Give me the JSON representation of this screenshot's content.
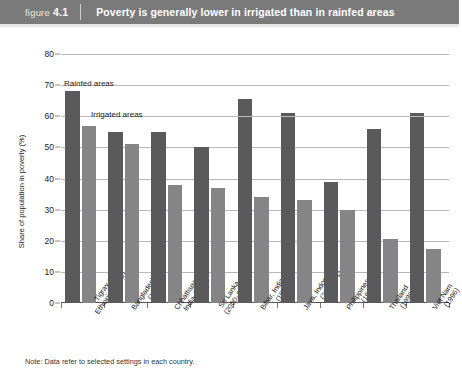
{
  "header": {
    "figure_word": "figure",
    "figure_number": "4.1",
    "title": "Poverty is generally lower in irrigated than in rainfed areas",
    "band_color": "#7a7a7a"
  },
  "note": "Note: Data refer to selected settings in each country.",
  "colors": {
    "rainfed": "#5a5a5c",
    "irrigated": "#858587",
    "gridline": "#b9b9b9",
    "axis": "#555555"
  },
  "chart_data": {
    "type": "bar",
    "title": "Poverty is generally lower in irrigated than in rainfed areas",
    "xlabel": "",
    "ylabel": "Share of population in poverty (%)",
    "ylim": [
      0,
      80
    ],
    "yticks": [
      0,
      10,
      20,
      30,
      40,
      50,
      60,
      70,
      80
    ],
    "ytick_labels": [
      "0",
      "10",
      "20",
      "30",
      "40",
      "50",
      "60",
      "70",
      "80"
    ],
    "grid": true,
    "legend_position": "inline-annotations",
    "annotations": [
      "Rainfed areas",
      "Irrigated areas"
    ],
    "categories": [
      "Tigray area,\nEthiopia (2000)",
      "Bangladesh\n(1997)",
      "Chhattisgarh,\nIndia (1996)",
      "Sri Lanka\n(2000–02)",
      "Bihar, India\n(1996)",
      "Java, Indonesia\n(2000–01)",
      "Philippines\n(1997)",
      "Thailand\n(1998)",
      "Viet Nam\n(1996)"
    ],
    "category_lines": [
      [
        "Tigray area,",
        "Ethiopia (2000)"
      ],
      [
        "Bangladesh",
        "(1997)"
      ],
      [
        "Chhattisgarh,",
        "India (1996)"
      ],
      [
        "Sri Lanka",
        "(2000–02)"
      ],
      [
        "Bihar, India",
        "(1996)"
      ],
      [
        "Java, Indonesia",
        "(2000–01)"
      ],
      [
        "Philippines",
        "(1997)"
      ],
      [
        "Thailand",
        "(1998)"
      ],
      [
        "Viet Nam",
        "(1996)"
      ]
    ],
    "series": [
      {
        "name": "Rainfed areas",
        "color": "#5a5a5c",
        "values": [
          68,
          55,
          55,
          50,
          65.5,
          61,
          39,
          56,
          61
        ]
      },
      {
        "name": "Irrigated areas",
        "color": "#858587",
        "values": [
          57,
          51,
          38,
          37,
          34,
          33,
          30,
          20.5,
          17.5
        ]
      }
    ]
  }
}
